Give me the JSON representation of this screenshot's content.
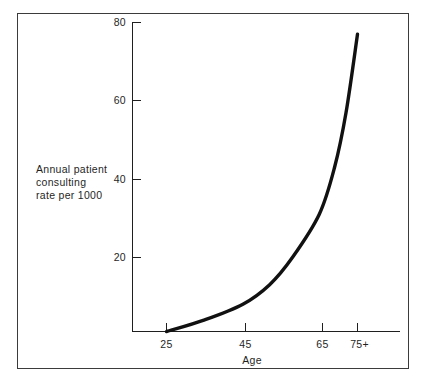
{
  "figure": {
    "frame_color": "#3b3b3b",
    "background": "#ffffff",
    "ink_color": "#111111"
  },
  "axes": {
    "y_label_line1": "Annual patient",
    "y_label_line2": "consulting",
    "y_label_line3": "rate per 1000",
    "x_title": "Age",
    "y_ticks": [
      "80",
      "60",
      "40",
      "20"
    ],
    "x_ticks": [
      "25",
      "45",
      "65",
      "75+"
    ]
  },
  "chart_data": {
    "type": "line",
    "title": "",
    "subtitle": "",
    "xlabel": "Age",
    "ylabel": "Annual patient consulting rate per 1000",
    "categories": [
      "25",
      "45",
      "65",
      "75+"
    ],
    "x": [
      25,
      45,
      65,
      75
    ],
    "values": [
      1,
      8,
      31,
      77
    ],
    "series": [
      {
        "name": "Annual patient consulting rate per 1000",
        "values": [
          1,
          8,
          31,
          77
        ]
      }
    ],
    "curve_points": [
      {
        "x": 25,
        "y": 1
      },
      {
        "x": 35,
        "y": 4
      },
      {
        "x": 45,
        "y": 8
      },
      {
        "x": 52,
        "y": 13
      },
      {
        "x": 58,
        "y": 20
      },
      {
        "x": 65,
        "y": 31
      },
      {
        "x": 69,
        "y": 43
      },
      {
        "x": 72,
        "y": 57
      },
      {
        "x": 75,
        "y": 77
      }
    ],
    "ylim": [
      0,
      80
    ],
    "xlim": [
      18,
      82
    ],
    "ytick_values": [
      20,
      40,
      60,
      80
    ],
    "xtick_values": [
      25,
      45,
      65,
      75
    ],
    "grid": false,
    "legend": "none",
    "legend_position": "none"
  }
}
